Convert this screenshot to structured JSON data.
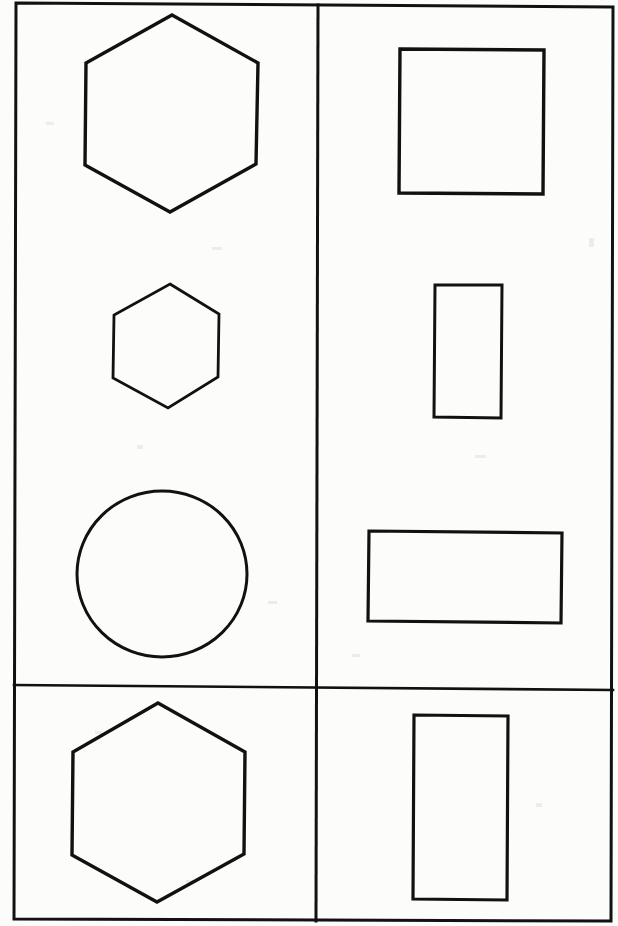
{
  "document": {
    "title": "Geometric Shapes Worksheet Scan",
    "kind": "scanned-line-drawing",
    "page_width": 618,
    "page_height": 926,
    "background_color": "#fcfcfb",
    "ink_color": "#111111"
  },
  "frame": {
    "name": "outer-border",
    "description": "Hand-ruled rectangular page border, slightly skewed",
    "stroke_width": 3.0,
    "points": "16,3 613,7 611,921 14,919"
  },
  "dividers": [
    {
      "name": "vertical-divider",
      "orientation": "vertical",
      "stroke_width": 3.0,
      "points": "318,5 316,921"
    },
    {
      "name": "horizontal-divider",
      "orientation": "horizontal",
      "stroke_width": 2.6,
      "points": "14,685 613,690"
    }
  ],
  "cells": [
    {
      "name": "cell-top-left",
      "row": 1,
      "column": 1,
      "shape_count": 3
    },
    {
      "name": "cell-top-right",
      "row": 1,
      "column": 2,
      "shape_count": 3
    },
    {
      "name": "cell-bottom-left",
      "row": 2,
      "column": 1,
      "shape_count": 1
    },
    {
      "name": "cell-bottom-right",
      "row": 2,
      "column": 2,
      "shape_count": 1
    }
  ],
  "shapes": [
    {
      "name": "large-hexagon",
      "type": "hexagon",
      "cell": "cell-top-left",
      "stroke_width": 3.4,
      "bbox": {
        "x": 84,
        "y": 14,
        "width": 176,
        "height": 199
      },
      "points": "172,15 258,63 256,164 170,212 85,165 86,63"
    },
    {
      "name": "small-hexagon",
      "type": "hexagon",
      "cell": "cell-top-left",
      "stroke_width": 2.8,
      "bbox": {
        "x": 112,
        "y": 283,
        "width": 108,
        "height": 126
      },
      "points": "170,284 219,314 218,377 168,408 113,378 114,315"
    },
    {
      "name": "circle",
      "type": "circle",
      "cell": "cell-top-left",
      "stroke_width": 3.0,
      "bbox": {
        "x": 77,
        "y": 490,
        "width": 170,
        "height": 167
      },
      "center_x": 162,
      "center_y": 574,
      "radius_x": 85,
      "radius_y": 83
    },
    {
      "name": "square",
      "type": "square",
      "cell": "cell-top-right",
      "stroke_width": 3.4,
      "bbox": {
        "x": 399,
        "y": 48,
        "width": 145,
        "height": 147
      },
      "points": "400,49 544,50 543,194 399,193"
    },
    {
      "name": "tall-rectangle",
      "type": "rectangle",
      "cell": "cell-top-right",
      "stroke_width": 3.0,
      "bbox": {
        "x": 434,
        "y": 284,
        "width": 69,
        "height": 134
      },
      "points": "435,285 502,285 501,418 434,417"
    },
    {
      "name": "wide-rectangle",
      "type": "rectangle",
      "cell": "cell-top-right",
      "stroke_width": 3.2,
      "bbox": {
        "x": 368,
        "y": 530,
        "width": 195,
        "height": 93
      },
      "points": "369,531 562,533 561,623 368,621"
    },
    {
      "name": "bottom-hexagon",
      "type": "hexagon",
      "cell": "cell-bottom-left",
      "stroke_width": 3.4,
      "bbox": {
        "x": 71,
        "y": 702,
        "width": 175,
        "height": 201
      },
      "points": "158,703 245,752 244,854 157,902 72,855 73,752"
    },
    {
      "name": "bottom-rectangle",
      "type": "rectangle",
      "cell": "cell-bottom-right",
      "stroke_width": 3.2,
      "bbox": {
        "x": 413,
        "y": 714,
        "width": 95,
        "height": 186
      },
      "points": "414,715 508,716 507,900 413,899"
    }
  ],
  "specks": [
    {
      "x": 46,
      "y": 122,
      "w": 8,
      "h": 3
    },
    {
      "x": 212,
      "y": 247,
      "w": 10,
      "h": 3
    },
    {
      "x": 137,
      "y": 445,
      "w": 6,
      "h": 4
    },
    {
      "x": 268,
      "y": 601,
      "w": 9,
      "h": 3
    },
    {
      "x": 95,
      "y": 731,
      "w": 7,
      "h": 3
    },
    {
      "x": 589,
      "y": 238,
      "w": 5,
      "h": 9
    },
    {
      "x": 475,
      "y": 455,
      "w": 11,
      "h": 3
    },
    {
      "x": 352,
      "y": 654,
      "w": 8,
      "h": 3
    },
    {
      "x": 536,
      "y": 803,
      "w": 6,
      "h": 4
    },
    {
      "x": 186,
      "y": 880,
      "w": 9,
      "h": 3
    }
  ]
}
